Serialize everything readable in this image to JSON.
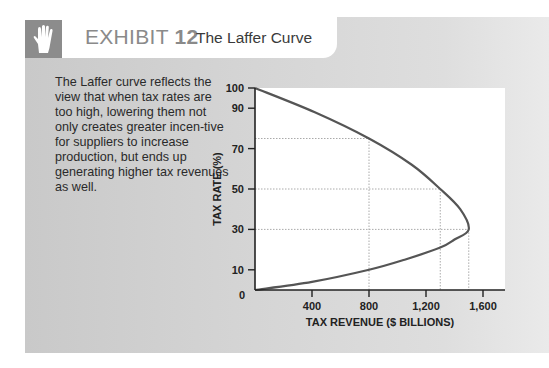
{
  "header": {
    "icon": "raised-hand-icon",
    "exhibit_label": "EXHIBIT",
    "exhibit_number": "12",
    "title": "The Laffer Curve"
  },
  "description": "The Laffer curve reflects the view that when tax rates are too high, lowering them not only creates greater incen-tive for suppliers to increase production, but ends up generating higher tax revenues as well.",
  "colors": {
    "panel": "#d0d0d0",
    "icon_box": "#8c8c8c",
    "curve": "#555555",
    "gridline": "#b5b5b5",
    "exhibit_text": "#8a8a8a"
  },
  "chart_data": {
    "type": "line",
    "title": "The Laffer Curve",
    "xlabel": "TAX REVENUE ($ BILLIONS)",
    "ylabel": "TAX RATE (%)",
    "xlim": [
      0,
      1750
    ],
    "ylim": [
      0,
      100
    ],
    "x_ticks": [
      "400",
      "800",
      "1,200",
      "1,600"
    ],
    "y_ticks": [
      "0",
      "10",
      "30",
      "50",
      "70",
      "90",
      "100"
    ],
    "grid": false,
    "reference_lines": [
      {
        "rate": 75,
        "revenue": 800
      },
      {
        "rate": 50,
        "revenue": 1300
      },
      {
        "rate": 30,
        "revenue": 1500
      }
    ],
    "series": [
      {
        "name": "Laffer curve",
        "points": [
          {
            "revenue": 0,
            "rate": 100
          },
          {
            "revenue": 420,
            "rate": 88
          },
          {
            "revenue": 800,
            "rate": 75
          },
          {
            "revenue": 1100,
            "rate": 62
          },
          {
            "revenue": 1300,
            "rate": 50
          },
          {
            "revenue": 1440,
            "rate": 40
          },
          {
            "revenue": 1500,
            "rate": 30
          },
          {
            "revenue": 1400,
            "rate": 25
          },
          {
            "revenue": 1300,
            "rate": 21
          },
          {
            "revenue": 1050,
            "rate": 15
          },
          {
            "revenue": 800,
            "rate": 10
          },
          {
            "revenue": 400,
            "rate": 4
          },
          {
            "revenue": 0,
            "rate": 0
          }
        ]
      }
    ]
  }
}
